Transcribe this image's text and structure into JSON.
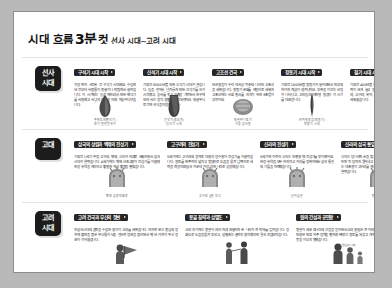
{
  "title": {
    "main": "시대 흐름",
    "number": "3분",
    "main2": "컷",
    "subtitle": "선사 시대~고려 시대"
  },
  "eras": [
    {
      "badge_line1": "선사",
      "badge_line2": "시대",
      "cards": [
        {
          "header": "구석기 시대 시작",
          "body": "가장 먼저 시작된 건 구석기 시대예요. 수십만 년 전부터 사람들이 동굴이나 막집에서 살았습니다. 이 시기에는 돌을 깨뜨려서 만든 뗀석기를 사용했고 사냥과 채집을 하며 떠돌아다녔습니다.",
          "figure": "hand-axe",
          "caption": "주먹도끼(뗀석기)\n경기 연천 전곡리"
        },
        {
          "header": "신석기 시대 시작",
          "body": "기원전 8000년쯤 되면 신석기 시대가 열립니다. 돌을 갈아서 날카롭게 만든 간석기를 쓰기 시작했고, 농사를 짓고 가축을 기르면서 한곳에 모여 사는 정착 생활이 시작되었어요. 빗살무늬 토기에 곡식을 저장했습니다.",
          "figure": "polished-axe",
          "caption": "간석기(돌도끼)\n신석기 시대"
        },
        {
          "header": "고조선 건국",
          "body": "단군왕검이 우리 역사상 최초의 나라인 고조선을 세웠습니다. 청동기 문화를 바탕으로 세워진 고조선에는 사회 질서를 지키기 위한 8조법이 있었어요.",
          "figure": "pottery",
          "caption": "빗살무늬 토기\n서울 암사동"
        },
        {
          "header": "청동기 시대 시작",
          "body": "기원전 1000년쯤 청동기가 들어오면서 빈부의 차이와 계급이 생겨났어요. 부족을 이끄는 군장이 나타났고, 고인돌과 비파형 동검이 이 시기를 대표합니다.",
          "figure": "bronze-dagger",
          "caption": "비파형 동검(청동기)\n청동기 시대"
        },
        {
          "header": "철기 시대 시작",
          "body": "기원전 400년쯤 철기가 보급되면서 농업 생산력이 크게 늘고 정복 전쟁이 활발해졌어요. 부여, 고구려, 옥저, 동예, 삼한 같은 여러 나라가 세워졌습니다.",
          "figure": "iron-blade",
          "caption": "세형 동검\n철기 시대"
        }
      ]
    },
    {
      "badge_line1": "고대",
      "badge_line2": "",
      "cards": [
        {
          "header": "삼국의 성립과 백제의 전성기",
          "body": "기원전 1세기 무렵 고구려, 백제, 신라가 차례로 세워지면서 삼국시대가 열렸습니다. 4세기에는 백제 근초고왕이 전성기를 이끌며 한강 유역을 차지하고 활발한 해상 활동을 펼쳤습니다.",
          "figure": "crown",
          "caption": "백제 금동대향로"
        },
        {
          "header": "고구려의 전성기",
          "body": "5세기에는 고구려의 광개토 대왕과 장수왕이 전성기를 이끌었습니다. 영토를 만주까지 넓히고 평양으로 도읍을 옮겨 남쪽으로 세력을 확장하며 삼국 가운데 가장 강한 나라로 성장했습니다.",
          "figure": "crown",
          "caption": "고구려 금관 장식"
        },
        {
          "header": "신라의 전성기",
          "body": "6세기에 이르러 신라는 진흥왕 때 전성기를 맞이했어요. 한강 유역을 모두 차지하고 가야를 정복하면서 삼국 통일의 기틀을 마련했습니다.",
          "figure": "crown",
          "caption": "신라 금관"
        },
        {
          "header": "신라의 삼국 통일과 발해",
          "body": "신라는 당나라와 손을 잡고 백제와 고구려를 차례로 무너뜨린 뒤 당까지 몰아내고 삼국을 통일했습니다. 북쪽에서는 대조영이 고구려를 계승한 발해를 세워 남북국 시대가 열렸습니다.",
          "figure": "crown",
          "caption": "발해 석등"
        }
      ]
    },
    {
      "badge_line1": "고려",
      "badge_line2": "시대",
      "cards": [
        {
          "header": "고려 건국과 무신의 정변",
          "body": "후삼국시대의 혼란을 수습한 왕건이 고려를 세웠습니다. 하지만 문신 중심의 정치에 불만을 품은 무신들이 난을 일으켜 정권을 잡으면서 백 년 가까이 무신 정권이 이어졌습니다.",
          "figure": "warrior",
          "caption": ""
        },
        {
          "header": "몽골 침략과 삼별초",
          "body": "고려 후기에는 몽골이 여러 차례 쳐들어와 온 나라가 큰 피해를 입었습니다. 강화도로 도읍을 옮겨 맞섰고, 삼별초는 끝까지 항전했지만 결국 진압되었습니다.",
          "figure": "two-figures",
          "caption": ""
        },
        {
          "header": "원의 간섭과 공민왕",
          "body": "몽골이 세운 원나라의 간섭을 받으면서 고려 왕실은 큰 어려움을 겪었습니다. 공민왕은 반원 자주 정책을 펼치며 빼앗긴 영토를 되찾고 개혁을 추진했지만 끝내 뜻을 이루지 못했습니다.",
          "figure": "three-figures",
          "caption": "",
          "mini_note": "원 간섭기 사회"
        }
      ]
    }
  ]
}
